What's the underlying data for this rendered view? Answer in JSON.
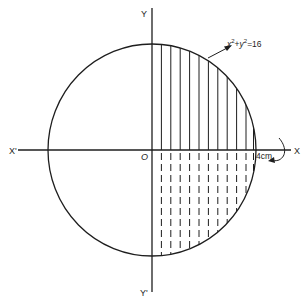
{
  "diagram": {
    "type": "geometry-figure",
    "equation_label": {
      "base": "x",
      "exp1": "2",
      "plus": "+",
      "base2": "y",
      "exp2": "2",
      "rhs": "=16"
    },
    "axis_labels": {
      "x_pos": "X",
      "x_neg": "X'",
      "y_pos": "Y",
      "y_neg": "Y'",
      "origin": "O"
    },
    "radius_label": "4cm",
    "radius": 4,
    "colors": {
      "stroke": "#1e1e1e",
      "background": "#ffffff"
    },
    "hatch_lines_count": 11
  }
}
